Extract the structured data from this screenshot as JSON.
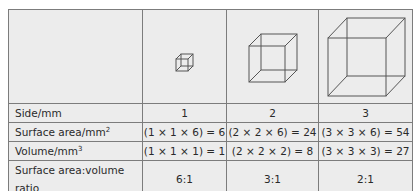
{
  "table": {
    "header_images": [
      {
        "side": 1,
        "icon": "cube-1mm-icon"
      },
      {
        "side": 2,
        "icon": "cube-2mm-icon"
      },
      {
        "side": 3,
        "icon": "cube-3mm-icon"
      }
    ],
    "rows": [
      {
        "label": "Side/mm",
        "label_sup": "",
        "values": [
          "1",
          "2",
          "3"
        ]
      },
      {
        "label": "Surface area/mm",
        "label_sup": "2",
        "values": [
          "(1 × 1 × 6) = 6",
          "(2 × 2 × 6) = 24",
          "(3 × 3 × 6) = 54"
        ]
      },
      {
        "label": "Volume/mm",
        "label_sup": "3",
        "values": [
          "(1 × 1 × 1) = 1",
          "(2 × 2 × 2) = 8",
          "(3 × 3 × 3) = 27"
        ]
      },
      {
        "label": "Surface area:volume ratio",
        "label_sup": "",
        "values": [
          "6:1",
          "3:1",
          "2:1"
        ]
      }
    ]
  },
  "colors": {
    "cell_background": "#ececec",
    "border": "#7c7c7c",
    "text": "#2a2a2a",
    "cube_stroke": "#555555"
  }
}
